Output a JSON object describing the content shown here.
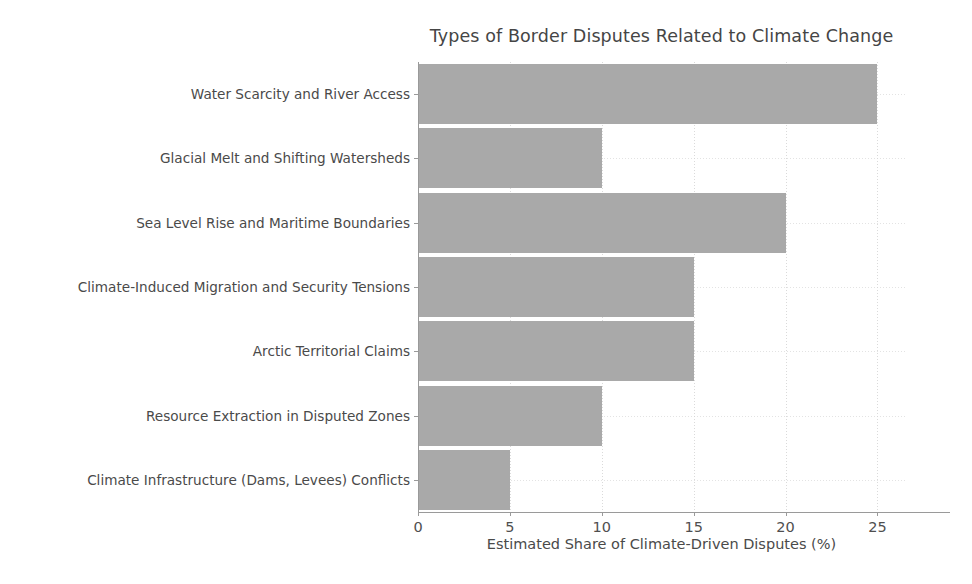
{
  "chart_data": {
    "type": "bar",
    "orientation": "horizontal",
    "title": "Types of Border Disputes Related to Climate Change",
    "xlabel": "Estimated Share of Climate-Driven Disputes (%)",
    "ylabel": "",
    "categories": [
      "Water Scarcity and River Access",
      "Glacial Melt and Shifting Watersheds",
      "Sea Level Rise and Maritime Boundaries",
      "Climate-Induced Migration and Security Tensions",
      "Arctic Territorial Claims",
      "Resource Extraction in Disputed Zones",
      "Climate Infrastructure (Dams, Levees) Conflicts"
    ],
    "values": [
      25,
      10,
      20,
      15,
      15,
      10,
      5
    ],
    "xlim": [
      0,
      26.5
    ],
    "xticks": [
      0,
      5,
      10,
      15,
      20,
      25
    ],
    "xtick_labels": [
      "0",
      "5",
      "10",
      "15",
      "20",
      "25"
    ],
    "grid": true,
    "legend": false,
    "bar_color": "#a9a9a9",
    "text_color": "#4a4a4a",
    "title_color": "#454545",
    "axis_color": "#9a9a9a",
    "grid_color": "#d4d4d4",
    "background": "#ffffff"
  }
}
